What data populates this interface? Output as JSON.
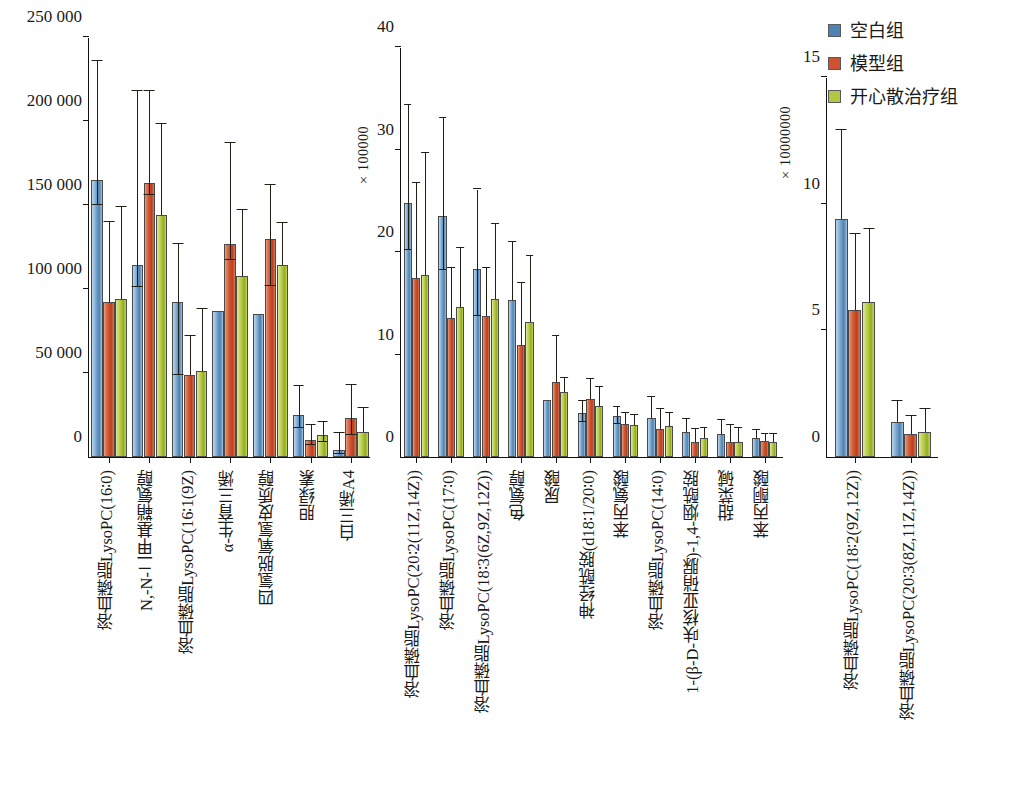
{
  "legend": {
    "items": [
      {
        "label": "空白组",
        "color": "#4f82b4",
        "key": "blank"
      },
      {
        "label": "模型组",
        "color": "#cf5230",
        "key": "model"
      },
      {
        "label": "开心散治疗组",
        "color": "#b2c843",
        "key": "treat"
      }
    ]
  },
  "chart_data": [
    {
      "id": "panel-1",
      "type": "bar",
      "title": "",
      "xlabel": "",
      "ylabel": "",
      "ylim": [
        0,
        250000
      ],
      "yticks": [
        0,
        50000,
        100000,
        150000,
        200000,
        250000
      ],
      "ytick_labels": [
        "0",
        "50 000",
        "100 000",
        "150 000",
        "200 000",
        "250 000"
      ],
      "axis_multiplier": "",
      "grid": false,
      "legend_position": "top-right (shared)",
      "categories": [
        "溶血磷脂LysoPC(16∶0)",
        "N,-N-二甲基鞘氨醇",
        "溶血磷脂LysoPC(16∶1(9Z)",
        "α-生育三烯",
        "四氢脱氧氢皮质醇",
        "胆绿素",
        "白三烯A4"
      ],
      "series": [
        {
          "name": "空白组",
          "values": [
            165000,
            114000,
            92000,
            87000,
            85000,
            25000,
            4000
          ],
          "err_low": [
            15000,
            13000,
            43000,
            0,
            0,
            8000,
            2000
          ],
          "err_high": [
            71000,
            104000,
            35000,
            0,
            0,
            17000,
            10000
          ]
        },
        {
          "name": "模型组",
          "values": [
            92000,
            163000,
            49000,
            127000,
            130000,
            10000,
            23000
          ],
          "err_low": [
            0,
            7000,
            0,
            10000,
            28000,
            3000,
            10000
          ],
          "err_high": [
            48000,
            55000,
            23000,
            60000,
            32000,
            9000,
            20000
          ]
        },
        {
          "name": "开心散治疗组",
          "values": [
            94000,
            144000,
            51000,
            108000,
            114000,
            13000,
            15000
          ],
          "err_low": [
            0,
            0,
            0,
            0,
            0,
            4000,
            0
          ],
          "err_high": [
            55000,
            54000,
            37000,
            39000,
            25000,
            8000,
            14000
          ]
        }
      ]
    },
    {
      "id": "panel-2",
      "type": "bar",
      "title": "",
      "xlabel": "",
      "ylabel": "",
      "ylim": [
        0,
        40
      ],
      "yticks": [
        0,
        10,
        20,
        30,
        40
      ],
      "ytick_labels": [
        "0",
        "10",
        "20",
        "30",
        "40"
      ],
      "axis_multiplier": "×100000",
      "grid": false,
      "legend_position": "top-right (shared)",
      "categories": [
        "溶血磷脂LysoPC(20∶2(11Z,14Z))",
        "溶血磷脂LysoPC(17∶0)",
        "溶血磷脂LysoPC(18∶3(6Z,9Z,12Z))",
        "色氨醇",
        "尿酸",
        "神经酰胺(d18∶1/20∶0)",
        "苯丙氨酸",
        "溶血磷脂LysoPC(14∶0)",
        "1-(β-D-呋核亚硝脲)-1,4-烟酰胺",
        "甜菜碱",
        "苯丙酮酸"
      ],
      "series": [
        {
          "name": "空白组",
          "values": [
            24.8,
            23.5,
            18.3,
            15.3,
            5.6,
            4.3,
            4.0,
            3.8,
            2.4,
            2.2,
            1.9
          ],
          "err_low": [
            4.6,
            5.3,
            4.5,
            0.0,
            0.0,
            0.9,
            0.8,
            0.0,
            0.0,
            0.0,
            0.0
          ],
          "err_high": [
            9.5,
            9.6,
            7.8,
            5.7,
            0.0,
            1.2,
            0.9,
            2.1,
            1.3,
            1.4,
            0.7
          ]
        },
        {
          "name": "模型组",
          "values": [
            17.5,
            13.6,
            13.8,
            10.9,
            7.3,
            5.7,
            3.2,
            2.7,
            1.5,
            1.5,
            1.6
          ],
          "err_low": [
            0.0,
            0.0,
            0.0,
            0.0,
            0.0,
            0.0,
            0.0,
            0.0,
            0.0,
            0.0,
            0.0
          ],
          "err_high": [
            9.2,
            4.8,
            4.6,
            6.1,
            4.5,
            1.9,
            1.1,
            2.0,
            1.2,
            1.6,
            0.6
          ]
        },
        {
          "name": "开心散治疗组",
          "values": [
            17.8,
            14.6,
            15.4,
            13.2,
            6.3,
            5.0,
            3.1,
            3.0,
            1.9,
            1.5,
            1.5
          ],
          "err_low": [
            0.0,
            0.0,
            0.0,
            0.0,
            0.0,
            0.0,
            0.0,
            0.0,
            0.0,
            0.0,
            0.0
          ],
          "err_high": [
            11.9,
            5.8,
            7.3,
            6.4,
            1.4,
            1.8,
            1.0,
            1.3,
            0.9,
            1.3,
            0.7
          ]
        }
      ]
    },
    {
      "id": "panel-3",
      "type": "bar",
      "title": "",
      "xlabel": "",
      "ylabel": "",
      "ylim": [
        0,
        15
      ],
      "yticks": [
        0,
        5,
        10,
        15
      ],
      "ytick_labels": [
        "0",
        "5",
        "10",
        "15"
      ],
      "axis_multiplier": "×10000000",
      "grid": false,
      "legend_position": "top-right (shared)",
      "categories": [
        "溶血磷脂LysoPC(18∶2(9Z,12Z))",
        "溶血磷脂LysoPC(20∶3(8Z,11Z,14Z))"
      ],
      "series": [
        {
          "name": "空白组",
          "values": [
            9.4,
            1.4
          ],
          "err_low": [
            0.0,
            0.0
          ],
          "err_high": [
            3.5,
            0.8
          ]
        },
        {
          "name": "模型组",
          "values": [
            5.8,
            0.9
          ],
          "err_low": [
            0.0,
            0.0
          ],
          "err_high": [
            3.0,
            0.7
          ]
        },
        {
          "name": "开心散治疗组",
          "values": [
            6.1,
            1.0
          ],
          "err_low": [
            0.0,
            0.0
          ],
          "err_high": [
            2.9,
            0.9
          ]
        }
      ]
    }
  ]
}
